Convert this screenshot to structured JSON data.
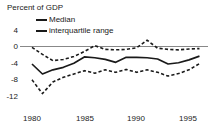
{
  "chart_data": {
    "type": "line",
    "title": "Percent of GDP",
    "xlabel": "",
    "ylabel": "",
    "xlim": [
      1980,
      1996
    ],
    "ylim": [
      -12,
      5
    ],
    "yticks": [
      4,
      0,
      -4,
      -8,
      -12
    ],
    "ytick_labels": [
      "4",
      "0",
      "-4",
      "-8",
      "-12"
    ],
    "xticks": [
      1980,
      1985,
      1990,
      1995
    ],
    "xtick_labels": [
      "1980",
      "1985",
      "1990",
      "1995"
    ],
    "grid": false,
    "zero_line": 0,
    "legend_position": "top-left",
    "legend": [
      {
        "name": "Median",
        "style": "solid"
      },
      {
        "name": "interquartile range",
        "style": "dashed"
      }
    ],
    "x": [
      1980,
      1981,
      1982,
      1983,
      1984,
      1985,
      1986,
      1987,
      1988,
      1989,
      1990,
      1991,
      1992,
      1993,
      1994,
      1995,
      1996
    ],
    "series": [
      {
        "name": "Median",
        "style": "solid",
        "values": [
          -4.2,
          -6.6,
          -5.6,
          -5.0,
          -4.0,
          -2.5,
          -2.7,
          -3.1,
          -3.8,
          -2.6,
          -2.6,
          -2.7,
          -3.0,
          -4.2,
          -3.9,
          -3.2,
          -2.3
        ]
      },
      {
        "name": "75th percentile",
        "style": "dashed",
        "values": [
          -0.2,
          -1.9,
          -3.4,
          -3.1,
          -2.4,
          -1.2,
          0.2,
          -0.7,
          -0.8,
          -0.7,
          -0.3,
          1.5,
          -0.4,
          -0.7,
          -0.8,
          -0.6,
          -0.5
        ]
      },
      {
        "name": "25th percentile",
        "style": "dashed",
        "values": [
          -8.0,
          -11.3,
          -8.5,
          -7.4,
          -6.6,
          -5.8,
          -6.4,
          -5.6,
          -6.2,
          -5.5,
          -6.2,
          -5.6,
          -6.2,
          -7.1,
          -6.5,
          -5.6,
          -4.1
        ]
      }
    ]
  },
  "colors": {
    "line": "#1a1a1a",
    "axis": "#808080",
    "background": "#ffffff"
  }
}
